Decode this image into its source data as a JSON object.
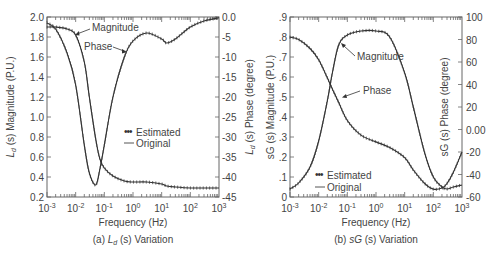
{
  "chart_data": [
    {
      "type": "line",
      "caption": "(a) L_d (s) Variation",
      "caption_prefix": "(a) ",
      "caption_italic": "L",
      "caption_sub": "d",
      "caption_suffix": " (s) Variation",
      "xlabel": "Frequency (Hz)",
      "xscale": "log",
      "xlim": [
        0.001,
        1000
      ],
      "x_ticks": [
        "10-3",
        "10-2",
        "10-1",
        "100",
        "101",
        "102",
        "103"
      ],
      "ylabel_left": "L_d (s) Magnitude (P.U.)",
      "ylabel_left_text": "(s) Magnitude (P.U.)",
      "ylim_left": [
        0.2,
        2.0
      ],
      "y_ticks_left": [
        "0.2",
        "0.4",
        "0.6",
        "0.8",
        "1.0",
        "1.2",
        "1.4",
        "1.6",
        "1.8",
        "2.0"
      ],
      "ylabel_right": "L_d (s) Phase (degree)",
      "ylabel_right_text": "(s) Phase (degree)",
      "ylim_right": [
        -45,
        0
      ],
      "y_ticks_right": [
        "-45",
        "-40",
        "-35",
        "-30",
        "-25",
        "-20",
        "-15",
        "-10",
        "-5",
        "0.0"
      ],
      "annotations": [
        "Magnitude",
        "Phase"
      ],
      "legend": [
        "Estimated",
        "Original"
      ],
      "legend_position": "center-right",
      "grid": false,
      "x": [
        0.001,
        0.002,
        0.005,
        0.01,
        0.02,
        0.03,
        0.05,
        0.07,
        0.1,
        0.2,
        0.5,
        1,
        3,
        10,
        15,
        30,
        100,
        300,
        1000
      ],
      "series": [
        {
          "name": "Magnitude",
          "axis": "left",
          "values": [
            1.9,
            1.9,
            1.88,
            1.82,
            1.55,
            1.2,
            0.78,
            0.58,
            0.49,
            0.41,
            0.36,
            0.35,
            0.35,
            0.33,
            0.31,
            0.3,
            0.29,
            0.29,
            0.29
          ]
        },
        {
          "name": "Phase",
          "axis": "right",
          "values": [
            -1.5,
            -3,
            -9,
            -17,
            -32,
            -39,
            -42,
            -38,
            -32,
            -20,
            -10,
            -6,
            -4,
            -5.5,
            -6.5,
            -5.5,
            -2.5,
            -1,
            -0.2
          ]
        }
      ]
    },
    {
      "type": "line",
      "caption": "(b) sG (s) Variation",
      "caption_prefix": "(b) ",
      "caption_italic": "sG",
      "caption_suffix": " (s) Variation",
      "xlabel": "Frequency (Hz)",
      "xscale": "log",
      "xlim": [
        0.001,
        1000
      ],
      "x_ticks": [
        "10-3",
        "10-2",
        "10-1",
        "100",
        "101",
        "102",
        "103"
      ],
      "ylabel_left": "sG (s) Magnitude (P.U.)",
      "ylim_left": [
        0,
        0.9
      ],
      "y_ticks_left": [
        "0",
        ".1",
        ".2",
        ".3",
        ".4",
        ".5",
        ".6",
        ".7",
        ".8",
        ".9"
      ],
      "ylabel_right": "sG (s) Phase (degree)",
      "ylim_right": [
        -60,
        100
      ],
      "y_ticks_right": [
        "-60",
        "-40",
        "-20",
        "0.00",
        "20",
        "40",
        "60",
        "80",
        "100"
      ],
      "annotations": [
        "Magnitude",
        "Phase"
      ],
      "legend": [
        "Estimated",
        "Original"
      ],
      "legend_position": "lower-left",
      "grid": false,
      "x": [
        0.001,
        0.002,
        0.005,
        0.01,
        0.02,
        0.03,
        0.05,
        0.1,
        0.3,
        1,
        3,
        10,
        20,
        50,
        100,
        200,
        300,
        500,
        1000
      ],
      "series": [
        {
          "name": "Magnitude",
          "axis": "left",
          "values": [
            0.04,
            0.07,
            0.15,
            0.28,
            0.48,
            0.62,
            0.76,
            0.81,
            0.83,
            0.83,
            0.8,
            0.62,
            0.45,
            0.22,
            0.1,
            0.05,
            0.04,
            0.05,
            0.06
          ]
        },
        {
          "name": "Phase",
          "axis": "right",
          "values": [
            82,
            80,
            72,
            62,
            46,
            36,
            24,
            8,
            -5,
            -11,
            -16,
            -25,
            -36,
            -48,
            -53,
            -52,
            -48,
            -38,
            -20
          ]
        }
      ]
    }
  ]
}
